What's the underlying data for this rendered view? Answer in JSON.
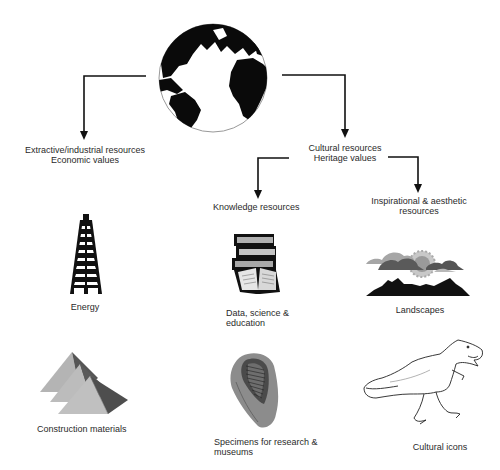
{
  "diagram": {
    "root": {
      "name": "Earth",
      "icon": "globe-icon"
    },
    "branches": {
      "extractive": {
        "title_line1": "Extractive/industrial resources",
        "title_line2": "Economic values",
        "items": [
          {
            "label": "Energy",
            "icon": "oil-derrick-icon"
          },
          {
            "label": "Construction materials",
            "icon": "pyramids-icon"
          }
        ]
      },
      "cultural": {
        "title_line1": "Cultural resources",
        "title_line2": "Heritage values",
        "knowledge": {
          "title": "Knowledge resources",
          "items": [
            {
              "label_line1": "Data, science &",
              "label_line2": "education",
              "icon": "books-icon"
            },
            {
              "label_line1": "Specimens for research &",
              "label_line2": "museums",
              "icon": "trilobite-fossil-icon"
            }
          ]
        },
        "inspirational": {
          "title_line1": "Inspirational & aesthetic",
          "title_line2": "resources",
          "items": [
            {
              "label": "Landscapes",
              "icon": "landscape-icon"
            },
            {
              "label": "Cultural icons",
              "icon": "dinosaur-icon"
            }
          ]
        }
      }
    },
    "colors": {
      "line": "#111111",
      "text": "#2a2a2a",
      "fill_dark": "#111111",
      "fill_gray": "#9a9a9a",
      "fill_light": "#c8c8c8"
    }
  }
}
